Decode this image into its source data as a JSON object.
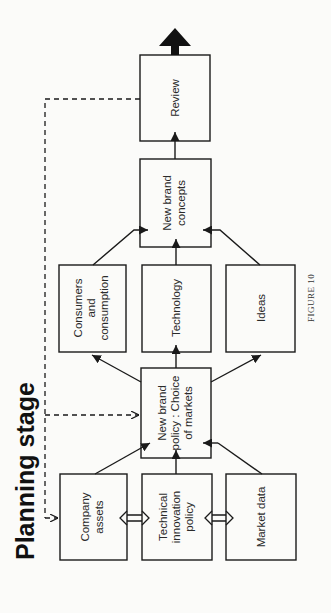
{
  "title": "Planning stage",
  "caption": "FIGURE 10",
  "colors": {
    "ink": "#1a1a1a",
    "background": "#fbfbf9"
  },
  "nodes": {
    "review": {
      "lines": [
        "Review"
      ]
    },
    "new_brand_concepts": {
      "lines": [
        "New brand",
        "concepts"
      ]
    },
    "consumers": {
      "lines": [
        "Consumers",
        "and",
        "consumption"
      ]
    },
    "technology": {
      "lines": [
        "Technology"
      ]
    },
    "ideas": {
      "lines": [
        "Ideas"
      ]
    },
    "new_brand_policy": {
      "lines": [
        "New brand",
        "policy : Choice",
        "of markets"
      ]
    },
    "company_assets": {
      "lines": [
        "Company",
        "assets"
      ]
    },
    "technical_innovation": {
      "lines": [
        "Technical",
        "innovation",
        "policy"
      ]
    },
    "market_data": {
      "lines": [
        "Market data"
      ]
    }
  },
  "edges": [
    {
      "from": "company_assets",
      "to": "new_brand_policy",
      "style": "solid"
    },
    {
      "from": "technical_innovation",
      "to": "new_brand_policy",
      "style": "solid"
    },
    {
      "from": "market_data",
      "to": "new_brand_policy",
      "style": "solid"
    },
    {
      "from": "company_assets",
      "to": "technical_innovation",
      "style": "double-headed"
    },
    {
      "from": "technical_innovation",
      "to": "market_data",
      "style": "double-headed"
    },
    {
      "from": "new_brand_policy",
      "to": "consumers",
      "style": "solid"
    },
    {
      "from": "new_brand_policy",
      "to": "technology",
      "style": "solid"
    },
    {
      "from": "new_brand_policy",
      "to": "ideas",
      "style": "solid"
    },
    {
      "from": "consumers",
      "to": "new_brand_concepts",
      "style": "solid"
    },
    {
      "from": "technology",
      "to": "new_brand_concepts",
      "style": "solid"
    },
    {
      "from": "ideas",
      "to": "new_brand_concepts",
      "style": "solid"
    },
    {
      "from": "new_brand_concepts",
      "to": "review",
      "style": "solid"
    },
    {
      "from": "review",
      "to": "output",
      "style": "bold"
    },
    {
      "from": "review",
      "to": "new_brand_policy",
      "style": "dashed"
    },
    {
      "from": "review",
      "to": "company_assets",
      "style": "dashed"
    }
  ]
}
